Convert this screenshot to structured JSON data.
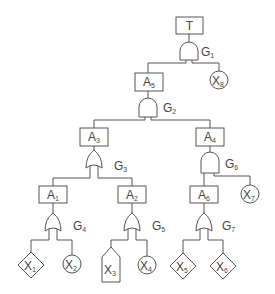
{
  "diagram": {
    "type": "fault-tree",
    "colors": {
      "stroke": "#555555",
      "text": "#444444",
      "background": "#ffffff"
    },
    "top_event": {
      "id": "T",
      "label": "T"
    },
    "intermediate_events": [
      {
        "id": "A5",
        "base": "A",
        "sub": "5"
      },
      {
        "id": "A3",
        "base": "A",
        "sub": "3"
      },
      {
        "id": "A4",
        "base": "A",
        "sub": "4"
      },
      {
        "id": "A1",
        "base": "A",
        "sub": "1"
      },
      {
        "id": "A2",
        "base": "A",
        "sub": "2"
      },
      {
        "id": "A6",
        "base": "A",
        "sub": "6"
      }
    ],
    "gates": [
      {
        "id": "G1",
        "base": "G",
        "sub": "1",
        "type": "AND",
        "output": "T",
        "inputs": [
          "A5",
          "X8"
        ]
      },
      {
        "id": "G2",
        "base": "G",
        "sub": "2",
        "type": "AND",
        "output": "A5",
        "inputs": [
          "A3",
          "A4"
        ]
      },
      {
        "id": "G3",
        "base": "G",
        "sub": "3",
        "type": "OR",
        "output": "A3",
        "inputs": [
          "A1",
          "A2"
        ]
      },
      {
        "id": "G6",
        "base": "G",
        "sub": "6",
        "type": "AND",
        "output": "A4",
        "inputs": [
          "A6",
          "X7"
        ]
      },
      {
        "id": "G4",
        "base": "G",
        "sub": "4",
        "type": "OR",
        "output": "A1",
        "inputs": [
          "X1",
          "X2"
        ]
      },
      {
        "id": "G5",
        "base": "G",
        "sub": "5",
        "type": "OR",
        "output": "A2",
        "inputs": [
          "X3",
          "X4"
        ]
      },
      {
        "id": "G7",
        "base": "G",
        "sub": "7",
        "type": "OR",
        "output": "A6",
        "inputs": [
          "X5",
          "X6"
        ]
      }
    ],
    "basic_events": [
      {
        "id": "X1",
        "base": "X",
        "sub": "1",
        "shape": "diamond"
      },
      {
        "id": "X2",
        "base": "X",
        "sub": "2",
        "shape": "circle"
      },
      {
        "id": "X3",
        "base": "X",
        "sub": "3",
        "shape": "house"
      },
      {
        "id": "X4",
        "base": "X",
        "sub": "4",
        "shape": "circle"
      },
      {
        "id": "X5",
        "base": "X",
        "sub": "5",
        "shape": "diamond"
      },
      {
        "id": "X6",
        "base": "X",
        "sub": "6",
        "shape": "diamond"
      },
      {
        "id": "X7",
        "base": "X",
        "sub": "7",
        "shape": "circle"
      },
      {
        "id": "X8",
        "base": "X",
        "sub": "8",
        "shape": "circle"
      }
    ]
  }
}
